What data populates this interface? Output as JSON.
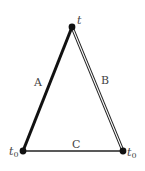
{
  "diagram": {
    "type": "spacetime-triangle",
    "vertices": {
      "top": {
        "label": "t",
        "x": 72,
        "y": 27
      },
      "bottom_left": {
        "label": "t",
        "sub": "0",
        "x": 23,
        "y": 151
      },
      "bottom_right": {
        "label": "t",
        "sub": "0",
        "x": 123,
        "y": 151
      }
    },
    "edges": {
      "A": {
        "label": "A",
        "style": "thick",
        "from": "bottom_left",
        "to": "top"
      },
      "B": {
        "label": "B",
        "style": "double",
        "from": "top",
        "to": "bottom_right"
      },
      "C": {
        "label": "C",
        "style": "thin",
        "from": "bottom_left",
        "to": "bottom_right"
      }
    },
    "colors": {
      "line": "#111111",
      "label": "#444444",
      "background": "#ffffff"
    }
  }
}
